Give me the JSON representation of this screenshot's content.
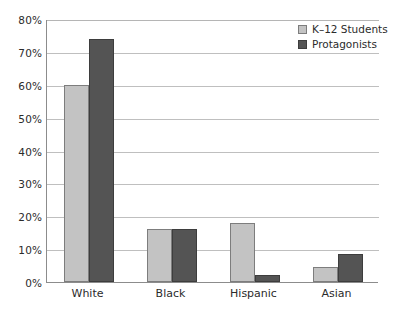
{
  "chart_data": {
    "type": "bar",
    "title": "",
    "xlabel": "",
    "ylabel": "",
    "categories": [
      "White",
      "Black",
      "Hispanic",
      "Asian"
    ],
    "series": [
      {
        "name": "K–12 Students",
        "color": "#c3c3c3",
        "values": [
          60,
          16,
          18,
          4.5
        ]
      },
      {
        "name": "Protagonists",
        "color": "#545454",
        "values": [
          74,
          16,
          2,
          8.5
        ]
      }
    ],
    "ylim": [
      0,
      80
    ],
    "ytick_step": 10,
    "ytick_labels": [
      "0%",
      "10%",
      "20%",
      "30%",
      "40%",
      "50%",
      "60%",
      "70%",
      "80%"
    ],
    "grid": true,
    "legend_position": "top-right",
    "annotations": []
  },
  "legend": {
    "items": [
      {
        "label": "K–12 Students",
        "swatch": "light-swatch"
      },
      {
        "label": "Protagonists",
        "swatch": "dark-swatch"
      }
    ]
  },
  "axis": {
    "y_labels": [
      "80%",
      "70%",
      "60%",
      "50%",
      "40%",
      "30%",
      "20%",
      "10%",
      "0%"
    ],
    "x_labels": [
      "White",
      "Black",
      "Hispanic",
      "Asian"
    ]
  },
  "colors": {
    "light_bar": "#c3c3c3",
    "dark_bar": "#545454",
    "gridline": "#bfbfbf",
    "axis": "#8c8c8c",
    "text": "#2b2b2b",
    "background": "#ffffff"
  }
}
